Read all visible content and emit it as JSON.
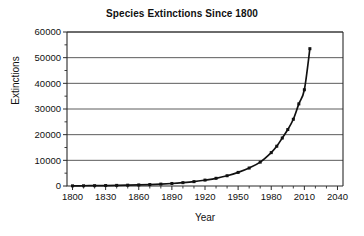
{
  "chart_data": {
    "type": "line",
    "title": "Species Extinctions Since 1800",
    "xlabel": "Year",
    "ylabel": "Extinctions",
    "xlim": [
      1795,
      2045
    ],
    "ylim": [
      0,
      60000
    ],
    "grid": "horizontal",
    "legend": "none",
    "marker": "square",
    "line_color": "#111111",
    "marker_color": "#111111",
    "grid_color": "#4a4a4a",
    "y_ticks": [
      0,
      10000,
      20000,
      30000,
      40000,
      50000,
      60000
    ],
    "y_tick_labels": [
      "0",
      "10000",
      "20000",
      "30000",
      "40000",
      "50000",
      "60000"
    ],
    "y_minor_ticks": [
      5000,
      15000,
      25000,
      35000,
      45000,
      55000
    ],
    "x_ticks": [
      1800,
      1830,
      1860,
      1890,
      1920,
      1950,
      1980,
      2010,
      2040
    ],
    "x_tick_labels": [
      "1800",
      "1830",
      "1860",
      "1890",
      "1920",
      "1950",
      "1980",
      "2010",
      "2040"
    ],
    "x_minor_step": 10,
    "x": [
      1800,
      1810,
      1820,
      1830,
      1840,
      1850,
      1860,
      1870,
      1880,
      1890,
      1900,
      1910,
      1920,
      1930,
      1940,
      1950,
      1960,
      1970,
      1980,
      1985,
      1990,
      1995,
      2000,
      2005,
      2010,
      2015
    ],
    "values": [
      60,
      90,
      130,
      180,
      240,
      320,
      420,
      560,
      740,
      980,
      1300,
      1700,
      2300,
      3000,
      4000,
      5300,
      7000,
      9300,
      13000,
      15500,
      18700,
      22000,
      26000,
      32000,
      37500,
      53500
    ],
    "series": [
      {
        "name": "Extinctions",
        "values": [
          60,
          90,
          130,
          180,
          240,
          320,
          420,
          560,
          740,
          980,
          1300,
          1700,
          2300,
          3000,
          4000,
          5300,
          7000,
          9300,
          13000,
          15500,
          18700,
          22000,
          26000,
          32000,
          37500,
          53500
        ]
      }
    ],
    "annotations": []
  }
}
